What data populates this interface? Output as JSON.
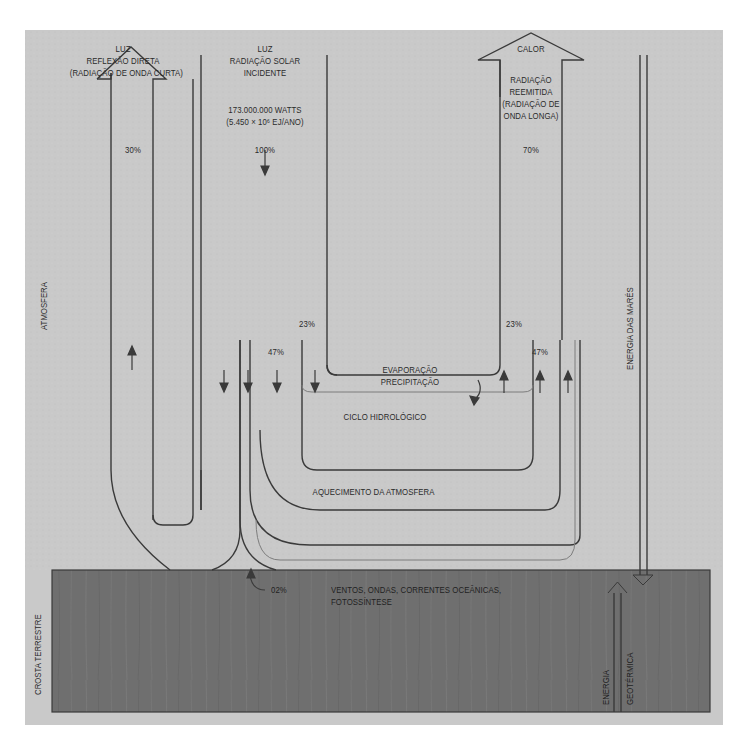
{
  "colors": {
    "atmosphere_bg": "#c9c9c9",
    "crust_bg": "#6f6f6f",
    "line": "#3a3a3a",
    "light_line": "#7d7d7d",
    "text": "#2b2b2b"
  },
  "labels": {
    "reflection": {
      "l1": "LUZ",
      "l2": "REFLEXÃO DIRETA",
      "l3": "(RADIAÇÃO DE ONDA CURTA)",
      "percent": "30%"
    },
    "incident": {
      "l1": "LUZ",
      "l2": "RADIAÇÃO SOLAR",
      "l3": "INCIDENTE",
      "watts": "173.000.000 WATTS",
      "ej": "(5.450 × 10⁶ EJ/ANO)",
      "percent": "100%"
    },
    "heat": {
      "title": "CALOR",
      "l1": "RADIAÇÃO",
      "l2": "REEMITIDA",
      "l3": "(RADIAÇÃO DE",
      "l4": "ONDA LONGA)",
      "percent": "70%"
    },
    "hydro_left_percent": "23%",
    "hydro_right_percent": "23%",
    "heating_left_percent": "47%",
    "heating_right_percent": "47%",
    "evaporation": "EVAPORAÇÃO",
    "precipitation": "PRECIPITAÇÃO",
    "hydro_cycle": "CICLO HIDROLÓGICO",
    "atmosphere_heating": "AQUECIMENTO DA ATMOSFERA",
    "winds_percent": "02%",
    "winds_l1": "VENTOS, ONDAS, CORRENTES OCEÂNICAS,",
    "winds_l2": "FOTOSSÍNTESE",
    "atmosphere": "ATMOSFERA",
    "crust": "CROSTA TERRESTRE",
    "tidal": "ENERGIA DAS MARÉS",
    "geo_l1": "ENERGIA",
    "geo_l2": "GEOTÉRMICA"
  }
}
